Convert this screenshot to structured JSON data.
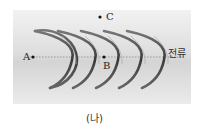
{
  "figure": {
    "caption": "(나)",
    "current_label": "전류",
    "points": [
      {
        "label": "A",
        "x": 33,
        "y": 57
      },
      {
        "label": "B",
        "x": 104,
        "y": 57
      },
      {
        "label": "C",
        "x": 100,
        "y": 17
      }
    ],
    "coil_turns": 5,
    "colors": {
      "wire": "#555555",
      "axis": "#888888",
      "background": "#dcdcdc"
    }
  }
}
